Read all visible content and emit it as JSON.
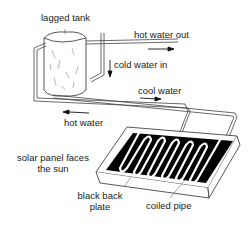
{
  "diagram": {
    "type": "solar water heating system",
    "labels": {
      "tank": "lagged tank",
      "hot_out": "hot water out",
      "cold_in": "cold water in",
      "cool_water": "cool water",
      "hot_water": "hot water",
      "panel_line1": "solar panel faces",
      "panel_line2": "the sun",
      "plate_line1": "black back",
      "plate_line2": "plate",
      "coil": "coiled pipe"
    },
    "colors": {
      "line": "#333333",
      "plate": "#000000",
      "background": "#ffffff"
    }
  }
}
